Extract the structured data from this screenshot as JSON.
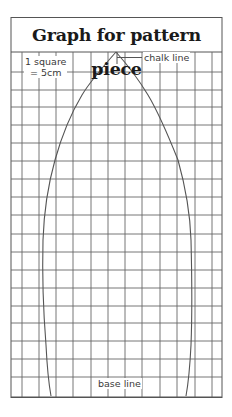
{
  "diagram": {
    "title": "Graph for pattern piece",
    "scale_line1": "1 square",
    "scale_line2": "= 5cm",
    "chalk_line_label": "chalk line",
    "base_line_label": "base line",
    "colors": {
      "grid": "#555555",
      "outline": "#555555",
      "text": "#1a1a1a",
      "background": "#ffffff"
    },
    "grid": {
      "columns_x": [
        22,
        39,
        56,
        73,
        91,
        108,
        125,
        142,
        160,
        177,
        195,
        212
      ],
      "rows_y": [
        72,
        90,
        107,
        125,
        143,
        161,
        179,
        197,
        215,
        234,
        252,
        270,
        288,
        306,
        323,
        341,
        359,
        377
      ]
    }
  }
}
